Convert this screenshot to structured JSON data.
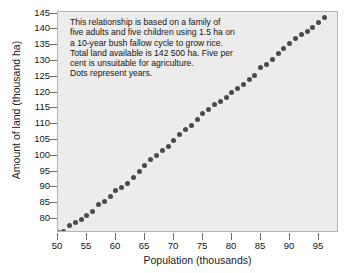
{
  "chart_data": {
    "type": "scatter",
    "title": "",
    "xlabel": "Population (thousands)",
    "ylabel": "Amount of land (thousand ha)",
    "xlim": [
      50,
      98.5
    ],
    "ylim": [
      75.6,
      145.5
    ],
    "xticks": [
      50,
      55,
      60,
      65,
      70,
      75,
      80,
      85,
      90,
      95
    ],
    "yticks": [
      80,
      85,
      90,
      95,
      100,
      105,
      110,
      115,
      120,
      125,
      130,
      135,
      140,
      145
    ],
    "grid": false,
    "legend": null,
    "marker_color": "#4b4b4b",
    "plot_background": "#ececec",
    "annotation_lines": [
      "This relationship is based on a family of",
      "five adults and five children using 1.5 ha on",
      "a 10-year bush fallow cycle to grow rice.",
      "Total land available is 142 500 ha. Five per",
      "cent is unsuitable for agriculture.",
      "Dots represent years."
    ],
    "x": [
      50.0,
      51.0,
      52.0,
      53.0,
      54.0,
      55.0,
      56.0,
      57.0,
      58.0,
      59.0,
      60.0,
      61.0,
      62.0,
      63.0,
      64.0,
      65.0,
      66.0,
      67.0,
      68.0,
      69.0,
      70.0,
      71.0,
      72.0,
      73.0,
      74.0,
      75.0,
      76.0,
      77.0,
      78.0,
      79.0,
      80.0,
      81.0,
      82.0,
      83.0,
      84.0,
      85.0,
      86.0,
      87.0,
      88.0,
      89.0,
      90.0,
      91.0,
      92.0,
      93.0,
      94.0,
      95.0,
      96.0
    ],
    "values": [
      75.8,
      76.1,
      77.9,
      79.0,
      80.0,
      81.2,
      82.3,
      84.5,
      85.5,
      87.2,
      88.9,
      90.0,
      91.2,
      93.2,
      95.0,
      96.9,
      98.9,
      100.1,
      101.7,
      103.1,
      104.8,
      106.8,
      108.3,
      109.6,
      111.4,
      113.3,
      114.8,
      116.1,
      117.2,
      118.4,
      120.0,
      121.4,
      122.6,
      124.0,
      125.4,
      127.8,
      129.0,
      130.4,
      132.4,
      133.9,
      135.5,
      137.0,
      138.4,
      139.4,
      140.6,
      142.2,
      143.9
    ]
  }
}
